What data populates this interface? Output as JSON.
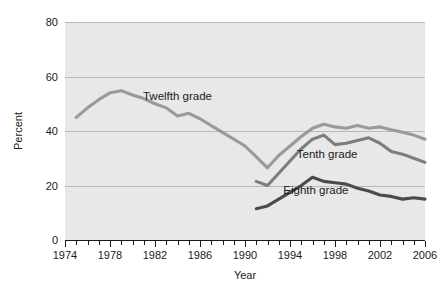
{
  "chart_data": {
    "type": "line",
    "title": "",
    "xlabel": "Year",
    "ylabel": "Percent",
    "xlim": [
      1974,
      2006
    ],
    "ylim": [
      0,
      80
    ],
    "grid": true,
    "legend_position": "inline-labels",
    "yticks": [
      0,
      20,
      40,
      60,
      80
    ],
    "ytick_labels": [
      "0",
      "20",
      "40",
      "60",
      "80"
    ],
    "xticks": [
      1974,
      1975,
      1976,
      1977,
      1978,
      1979,
      1980,
      1981,
      1982,
      1983,
      1984,
      1985,
      1986,
      1987,
      1988,
      1989,
      1990,
      1991,
      1992,
      1993,
      1994,
      1995,
      1996,
      1997,
      1998,
      1999,
      2000,
      2001,
      2002,
      2003,
      2004,
      2005,
      2006
    ],
    "xtick_labels": [
      "1974",
      "1978",
      "1982",
      "1986",
      "1990",
      "1994",
      "1998",
      "2002",
      "2006"
    ],
    "xtick_labelled_years": [
      1974,
      1978,
      1982,
      1986,
      1990,
      1994,
      1998,
      2002,
      2006
    ],
    "series": [
      {
        "name": "Twelfth grade",
        "color": "#9a9a9a",
        "label_x": 1984.0,
        "label_y": 51.5,
        "x": [
          1975,
          1976,
          1977,
          1978,
          1979,
          1980,
          1981,
          1982,
          1983,
          1984,
          1985,
          1986,
          1987,
          1988,
          1989,
          1990,
          1991,
          1992,
          1993,
          1994,
          1995,
          1996,
          1997,
          1998,
          1999,
          2000,
          2001,
          2002,
          2003,
          2004,
          2005,
          2006
        ],
        "y": [
          45.0,
          48.5,
          51.5,
          54.0,
          54.8,
          53.2,
          51.9,
          50.0,
          48.5,
          45.5,
          46.5,
          44.5,
          42.0,
          39.5,
          37.0,
          34.5,
          30.5,
          26.5,
          31.0,
          34.5,
          38.0,
          41.0,
          42.5,
          41.5,
          41.0,
          42.0,
          41.0,
          41.5,
          40.5,
          39.5,
          38.5,
          37.0
        ]
      },
      {
        "name": "Tenth grade",
        "color": "#7d7d7d",
        "label_x": 1997.3,
        "label_y": 30.0,
        "x": [
          1991,
          1992,
          1993,
          1994,
          1995,
          1996,
          1997,
          1998,
          1999,
          2000,
          2001,
          2002,
          2003,
          2004,
          2005,
          2006
        ],
        "y": [
          21.5,
          20.0,
          24.5,
          29.0,
          33.5,
          37.0,
          38.5,
          35.0,
          35.5,
          36.5,
          37.5,
          35.5,
          32.5,
          31.5,
          30.0,
          28.5
        ]
      },
      {
        "name": "Eighth grade",
        "color": "#4a4a4a",
        "label_x": 1996.3,
        "label_y": 17.0,
        "x": [
          1991,
          1992,
          1993,
          1994,
          1995,
          1996,
          1997,
          1998,
          1999,
          2000,
          2001,
          2002,
          2003,
          2004,
          2005,
          2006
        ],
        "y": [
          11.5,
          12.5,
          15.0,
          17.5,
          20.0,
          23.0,
          21.5,
          21.0,
          20.5,
          19.0,
          18.0,
          16.5,
          16.0,
          15.0,
          15.5,
          15.0
        ]
      }
    ]
  },
  "axes": {
    "y_title": "Percent",
    "x_title": "Year"
  }
}
